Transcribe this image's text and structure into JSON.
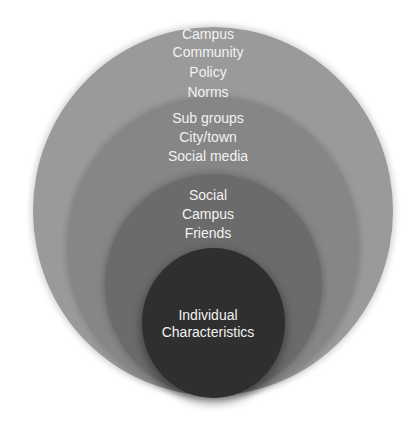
{
  "diagram": {
    "type": "nested-ellipses",
    "layers": [
      {
        "level": "outer",
        "color": "#9a9a9a",
        "lines": [
          "Campus",
          "Community",
          "Policy",
          "Norms"
        ]
      },
      {
        "level": "second",
        "color": "#868686",
        "lines": [
          "Sub groups",
          "City/town",
          "Social media"
        ]
      },
      {
        "level": "third",
        "color": "#6b6b6b",
        "lines": [
          "Social",
          "Campus",
          "Friends"
        ]
      },
      {
        "level": "inner",
        "color": "#2f2f2f",
        "lines": [
          "Individual",
          "Characteristics"
        ]
      }
    ],
    "text_color": "#f2f2f2",
    "background": "#ffffff"
  }
}
